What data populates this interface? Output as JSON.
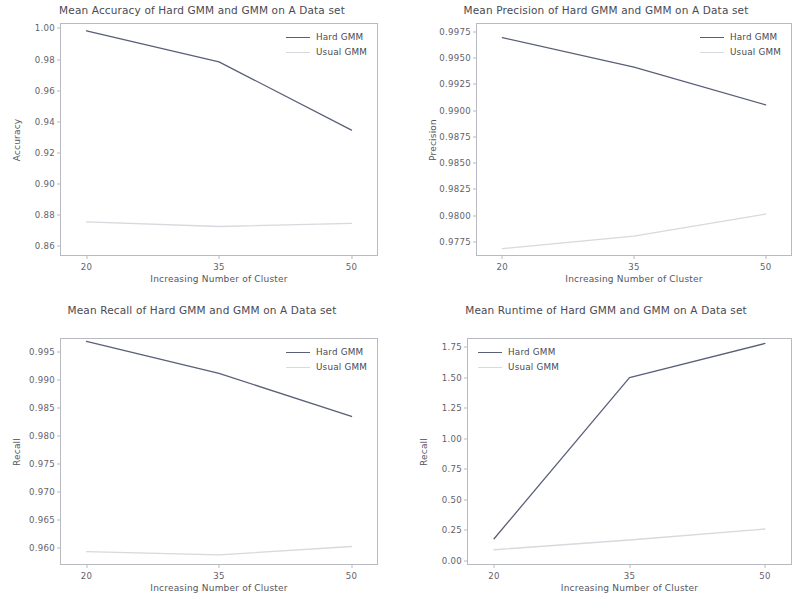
{
  "figure": {
    "background": "#ffffff",
    "series_colors": {
      "hard": "#5a5f78",
      "usual": "#d8d8de"
    },
    "axis_color": "#b9b9c2",
    "text_color": "#4a4a52"
  },
  "legend_labels": {
    "hard": "Hard GMM",
    "usual": "Usual GMM"
  },
  "chart_data": [
    {
      "type": "line",
      "title": "Mean Accuracy of Hard GMM and GMM on A Data set",
      "xlabel": "Increasing Number of Cluster",
      "ylabel": "Accuracy",
      "x": [
        20,
        35,
        50
      ],
      "xticks": [
        "20",
        "35",
        "50"
      ],
      "yticks": [
        "1.00",
        "0.98",
        "0.96",
        "0.94",
        "0.92",
        "0.90",
        "0.88",
        "0.86"
      ],
      "ytickvals": [
        1.0,
        0.98,
        0.96,
        0.94,
        0.92,
        0.9,
        0.88,
        0.86
      ],
      "ylim": [
        0.8535,
        1.0035
      ],
      "xlim": [
        17.0,
        53.0
      ],
      "grid": false,
      "legend_position": "upper right",
      "series": [
        {
          "name": "Hard GMM",
          "values": [
            0.9985,
            0.9785,
            0.9345
          ],
          "color": "#5a5f78"
        },
        {
          "name": "Usual GMM",
          "values": [
            0.8755,
            0.8725,
            0.8745
          ],
          "color": "#d8d8de"
        }
      ]
    },
    {
      "type": "line",
      "title": "Mean Precision of Hard GMM and GMM on A Data set",
      "xlabel": "Increasing Number of Cluster",
      "ylabel": "Precision",
      "x": [
        20,
        35,
        50
      ],
      "xticks": [
        "20",
        "35",
        "50"
      ],
      "yticks": [
        "0.9975",
        "0.9950",
        "0.9925",
        "0.9900",
        "0.9875",
        "0.9850",
        "0.9825",
        "0.9800",
        "0.9775"
      ],
      "ytickvals": [
        0.9975,
        0.995,
        0.9925,
        0.99,
        0.9875,
        0.985,
        0.9825,
        0.98,
        0.9775
      ],
      "ylim": [
        0.97615,
        0.99835
      ],
      "xlim": [
        17.0,
        53.0
      ],
      "grid": false,
      "legend_position": "upper right",
      "series": [
        {
          "name": "Hard GMM",
          "values": [
            0.99695,
            0.99415,
            0.99055
          ],
          "color": "#5a5f78"
        },
        {
          "name": "Usual GMM",
          "values": [
            0.97685,
            0.97805,
            0.98015
          ],
          "color": "#d8d8de"
        }
      ]
    },
    {
      "type": "line",
      "title": "Mean Recall of Hard GMM and GMM on A Data set",
      "xlabel": "Increasing Number of Cluster",
      "ylabel": "Recall",
      "x": [
        20,
        35,
        50
      ],
      "xticks": [
        "20",
        "35",
        "50"
      ],
      "yticks": [
        "0.995",
        "0.990",
        "0.985",
        "0.980",
        "0.975",
        "0.970",
        "0.965",
        "0.960"
      ],
      "ytickvals": [
        0.995,
        0.99,
        0.985,
        0.98,
        0.975,
        0.97,
        0.965,
        0.96
      ],
      "ylim": [
        0.957,
        0.9975
      ],
      "xlim": [
        17.0,
        53.0
      ],
      "grid": false,
      "legend_position": "upper right",
      "series": [
        {
          "name": "Hard GMM",
          "values": [
            0.9969,
            0.9912,
            0.9835
          ],
          "color": "#5a5f78"
        },
        {
          "name": "Usual GMM",
          "values": [
            0.9594,
            0.9588,
            0.9603
          ],
          "color": "#d8d8de"
        }
      ]
    },
    {
      "type": "line",
      "title": "Mean Runtime of Hard GMM and GMM on A Data set",
      "xlabel": "Increasing Number of Cluster",
      "ylabel": "Recall",
      "x": [
        20,
        35,
        50
      ],
      "xticks": [
        "20",
        "35",
        "50"
      ],
      "yticks": [
        "1.75",
        "1.50",
        "1.25",
        "1.00",
        "0.75",
        "0.50",
        "0.25",
        "0.00"
      ],
      "ytickvals": [
        1.75,
        1.5,
        1.25,
        1.0,
        0.75,
        0.5,
        0.25,
        0.0
      ],
      "ylim": [
        -0.035,
        1.825
      ],
      "xlim": [
        17.0,
        53.0
      ],
      "grid": false,
      "legend_position": "upper left",
      "series": [
        {
          "name": "Hard GMM",
          "values": [
            0.18,
            1.5,
            1.78
          ],
          "color": "#5a5f78"
        },
        {
          "name": "Usual GMM",
          "values": [
            0.09,
            0.17,
            0.26
          ],
          "color": "#d8d8de"
        }
      ]
    }
  ]
}
